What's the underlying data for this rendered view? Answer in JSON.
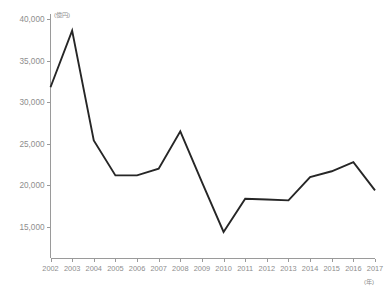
{
  "chart_data": {
    "type": "line",
    "title": "",
    "subtitle": "",
    "xlabel": "(年)",
    "ylabel": "(億円)",
    "x": [
      2002,
      2003,
      2004,
      2005,
      2006,
      2007,
      2008,
      2009,
      2010,
      2011,
      2012,
      2013,
      2014,
      2015,
      2016,
      2017
    ],
    "categories": [
      "2002",
      "2003",
      "2004",
      "2005",
      "2006",
      "2007",
      "2008",
      "2009",
      "2010",
      "2011",
      "2012",
      "2013",
      "2014",
      "2015",
      "2016",
      "2017"
    ],
    "values": [
      31800,
      38600,
      25400,
      21200,
      21200,
      22000,
      26500,
      20400,
      14400,
      18400,
      18300,
      18200,
      21000,
      21700,
      22800,
      19400
    ],
    "series": [
      {
        "name": "",
        "values": [
          31800,
          38600,
          25400,
          21200,
          21200,
          22000,
          26500,
          20400,
          14400,
          18400,
          18300,
          18200,
          21000,
          21700,
          22800,
          19400
        ]
      }
    ],
    "ylim": [
      12500,
      40000
    ],
    "xlim": [
      2002,
      2017
    ],
    "y_ticks": [
      15000,
      20000,
      25000,
      30000,
      35000,
      40000
    ],
    "y_tick_labels": [
      "15,000",
      "20,000",
      "25,000",
      "30,000",
      "35,000",
      "40,000"
    ],
    "x_ticks": [
      2002,
      2003,
      2004,
      2005,
      2006,
      2007,
      2008,
      2009,
      2010,
      2011,
      2012,
      2013,
      2014,
      2015,
      2016,
      2017
    ],
    "x_tick_labels": [
      "2002",
      "2003",
      "2004",
      "2005",
      "2006",
      "2007",
      "2008",
      "2009",
      "2010",
      "2011",
      "2012",
      "2013",
      "2014",
      "2015",
      "2016",
      "2017"
    ],
    "grid": false,
    "legend": false,
    "legend_position": "none",
    "line_color": "#262626",
    "axis_color": "#9a9a9a",
    "label_color": "#8d8d8d",
    "background_color": "#ffffff",
    "annotations": []
  }
}
